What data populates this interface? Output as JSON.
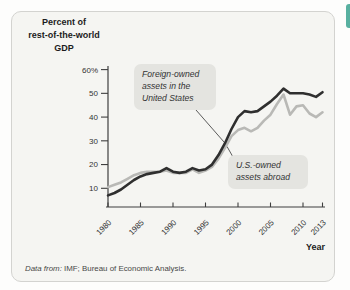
{
  "panel": {
    "background": "#f5f5f2",
    "border_color": "#d3d3d0",
    "edge_tab_color": "#58b0a0"
  },
  "chart_data": {
    "type": "line",
    "title": "Percent of rest-of-the-world GDP",
    "ylabel_lines": "Percent of\nrest-of-the-world\nGDP",
    "xlabel": "Year",
    "x": [
      1980,
      1981,
      1982,
      1983,
      1984,
      1985,
      1986,
      1987,
      1988,
      1989,
      1990,
      1991,
      1992,
      1993,
      1994,
      1995,
      1996,
      1997,
      1998,
      1999,
      2000,
      2001,
      2002,
      2003,
      2004,
      2005,
      2006,
      2007,
      2008,
      2009,
      2010,
      2011,
      2012,
      2013
    ],
    "x_ticks": [
      1980,
      1985,
      1990,
      1995,
      2000,
      2005,
      2010,
      2013
    ],
    "y_ticks": [
      10,
      20,
      30,
      40,
      50,
      60
    ],
    "y_tick_labels": [
      "10",
      "20",
      "30",
      "40",
      "50",
      "60%"
    ],
    "ylim": [
      0,
      62
    ],
    "grid": false,
    "series": [
      {
        "name": "Foreign-owned assets in the United States",
        "color": "#2f2f2f",
        "values": [
          7,
          8,
          9.5,
          11.5,
          13.5,
          15,
          16,
          16.5,
          17,
          18.5,
          17,
          16.5,
          17,
          18.5,
          17.5,
          18,
          20,
          24,
          29,
          35,
          40,
          42.5,
          42,
          42.5,
          44.5,
          46.5,
          49,
          52,
          50,
          50,
          50,
          49.5,
          48.5,
          50.5
        ]
      },
      {
        "name": "U.S.-owned assets abroad",
        "color": "#b9b9b6",
        "values": [
          10.5,
          11.5,
          12.5,
          14,
          15.5,
          16.5,
          17,
          17,
          17,
          17.5,
          16.5,
          16.5,
          16.5,
          18,
          16.5,
          17.5,
          19,
          22.5,
          27,
          32,
          34.5,
          35.5,
          34,
          35.5,
          38.5,
          41,
          45.5,
          49.5,
          41,
          44.5,
          45,
          41.5,
          40,
          42
        ]
      }
    ],
    "annotations": [
      {
        "label": "Foreign-owned\nassets in the\nUnited States"
      },
      {
        "label": "U.S.-owned\nassets abroad"
      }
    ]
  },
  "footer": {
    "prefix": "Data from:",
    "text": " IMF; Bureau of Economic Analysis."
  }
}
